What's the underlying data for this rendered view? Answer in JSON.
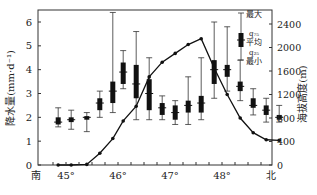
{
  "chart_data": {
    "type": "box",
    "title": "",
    "xlabel_left": "南",
    "xlabel_right": "北",
    "ylabel_left": "降水量(mm·d⁻¹)",
    "ylabel_right": "海拔高度(m)",
    "x_ticks": [
      "45°",
      "46°",
      "47°",
      "48°"
    ],
    "y_left_ticks": [
      0,
      1,
      2,
      3,
      4,
      5,
      6
    ],
    "y_right_ticks": [
      0,
      400,
      800,
      1200,
      1600,
      2000,
      2400
    ],
    "ylim_left": [
      0,
      6.6
    ],
    "ylim_right": [
      0,
      2640
    ],
    "legend": {
      "max": "最大",
      "q75": "q₇₅",
      "mean": "平均",
      "q25": "q₂₅",
      "min": "最小"
    },
    "precip_boxes": [
      {
        "lat": 44.85,
        "max": 2.4,
        "q75": 2.0,
        "mean": 1.8,
        "q25": 1.7,
        "min": 1.6
      },
      {
        "lat": 45.1,
        "max": 2.3,
        "q75": 2.0,
        "mean": 1.9,
        "q25": 1.8,
        "min": 1.5
      },
      {
        "lat": 45.4,
        "max": 2.2,
        "q75": 2.05,
        "mean": 2.0,
        "q25": 1.9,
        "min": 1.4
      },
      {
        "lat": 45.65,
        "max": 3.1,
        "q75": 2.8,
        "mean": 2.6,
        "q25": 2.3,
        "min": 2.0
      },
      {
        "lat": 45.9,
        "max": 6.4,
        "q75": 3.5,
        "mean": 3.1,
        "q25": 2.6,
        "min": 2.2
      },
      {
        "lat": 46.1,
        "max": 4.8,
        "q75": 4.3,
        "mean": 3.9,
        "q25": 3.4,
        "min": 3.2
      },
      {
        "lat": 46.35,
        "max": 5.6,
        "q75": 4.2,
        "mean": 3.4,
        "q25": 2.8,
        "min": 1.9
      },
      {
        "lat": 46.6,
        "max": 4.5,
        "q75": 3.6,
        "mean": 3.0,
        "q25": 2.3,
        "min": 1.9
      },
      {
        "lat": 46.85,
        "max": 2.9,
        "q75": 2.6,
        "mean": 2.4,
        "q25": 2.1,
        "min": 1.9
      },
      {
        "lat": 47.1,
        "max": 2.7,
        "q75": 2.5,
        "mean": 2.2,
        "q25": 1.9,
        "min": 1.7
      },
      {
        "lat": 47.35,
        "max": 3.7,
        "q75": 2.7,
        "mean": 2.5,
        "q25": 2.2,
        "min": 1.7
      },
      {
        "lat": 47.6,
        "max": 4.5,
        "q75": 2.9,
        "mean": 2.6,
        "q25": 2.2,
        "min": 1.9
      },
      {
        "lat": 47.85,
        "max": 6.0,
        "q75": 4.4,
        "mean": 4.0,
        "q25": 3.4,
        "min": 2.8
      },
      {
        "lat": 48.1,
        "max": 5.8,
        "q75": 4.2,
        "mean": 4.0,
        "q25": 3.7,
        "min": 3.1
      },
      {
        "lat": 48.35,
        "max": 4.4,
        "q75": 3.5,
        "mean": 3.3,
        "q25": 3.1,
        "min": 2.7
      },
      {
        "lat": 48.6,
        "max": 3.2,
        "q75": 2.8,
        "mean": 2.5,
        "q25": 2.4,
        "min": 2.1
      },
      {
        "lat": 48.85,
        "max": 2.8,
        "q75": 2.5,
        "mean": 2.3,
        "q25": 2.1,
        "min": 1.8
      },
      {
        "lat": 49.1,
        "max": 2.5,
        "q75": 2.1,
        "mean": 2.0,
        "q25": 1.9,
        "min": 1.8
      }
    ],
    "elevation_line": {
      "lat": [
        44.85,
        45.1,
        45.4,
        45.65,
        45.9,
        46.1,
        46.35,
        46.6,
        46.85,
        47.1,
        47.35,
        47.6,
        47.85,
        48.1,
        48.35,
        48.6,
        48.85,
        49.1
      ],
      "elevation": [
        0,
        0,
        10,
        200,
        450,
        750,
        1000,
        1500,
        1750,
        1900,
        2050,
        2150,
        1650,
        1200,
        800,
        550,
        430,
        420
      ]
    }
  }
}
